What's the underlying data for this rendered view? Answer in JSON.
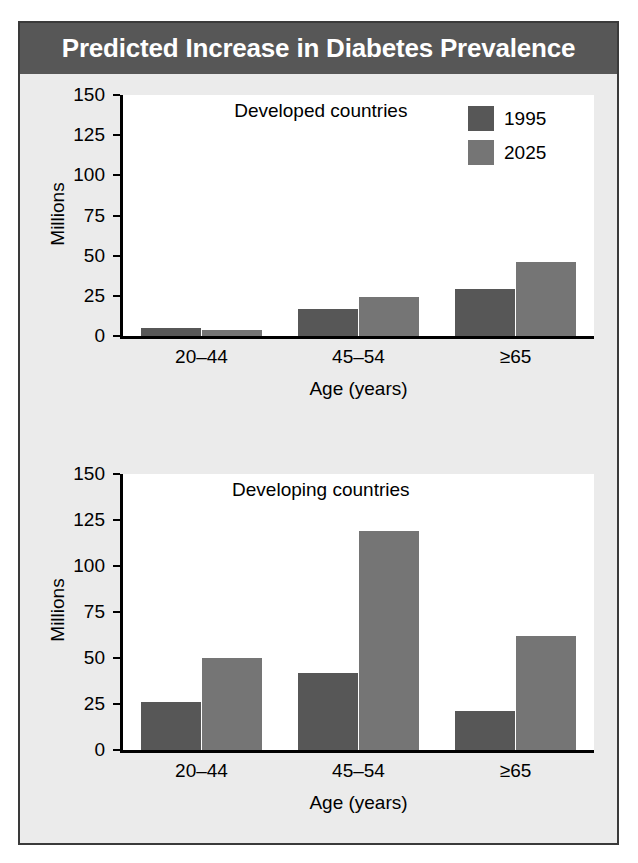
{
  "figure": {
    "title": "Predicted Increase in Diabetes Prevalence",
    "title_bg": "#575757",
    "title_color": "#ffffff",
    "panel_bg": "#ebebeb",
    "plot_bg": "#ffffff",
    "border_color": "#3a3a3a"
  },
  "legend": {
    "position": "top-right",
    "entries": [
      {
        "label": "1995",
        "color": "#575757"
      },
      {
        "label": "2025",
        "color": "#757575"
      }
    ]
  },
  "axis": {
    "ylabel": "Millions",
    "xlabel": "Age (years)",
    "yticks": [
      "150",
      "125",
      "100",
      "75",
      "50",
      "25",
      "0"
    ],
    "xticks": [
      "20–44",
      "45–54",
      "≥65"
    ]
  },
  "panels": [
    {
      "note": "Developed countries"
    },
    {
      "note": "Developing countries"
    }
  ],
  "chart_data": [
    {
      "type": "bar",
      "title": "Developed countries",
      "categories": [
        "20–44",
        "45–54",
        "≥65"
      ],
      "series": [
        {
          "name": "1995",
          "color": "#575757",
          "values": [
            5,
            17,
            29
          ]
        },
        {
          "name": "2025",
          "color": "#757575",
          "values": [
            4,
            24,
            46
          ]
        }
      ],
      "xlabel": "Age (years)",
      "ylabel": "Millions",
      "ylim": [
        0,
        150
      ],
      "ytick_step": 25,
      "grid": false,
      "legend": "top-right"
    },
    {
      "type": "bar",
      "title": "Developing countries",
      "categories": [
        "20–44",
        "45–54",
        "≥65"
      ],
      "series": [
        {
          "name": "1995",
          "color": "#575757",
          "values": [
            26,
            42,
            21
          ]
        },
        {
          "name": "2025",
          "color": "#757575",
          "values": [
            50,
            119,
            62
          ]
        }
      ],
      "xlabel": "Age (years)",
      "ylabel": "Millions",
      "ylim": [
        0,
        150
      ],
      "ytick_step": 25,
      "grid": false,
      "legend": "none"
    }
  ]
}
